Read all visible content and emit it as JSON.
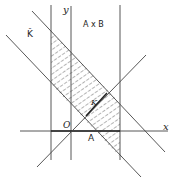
{
  "diagram": {
    "labels": {
      "y_axis": "y",
      "x_axis": "x",
      "origin": "O",
      "point_a": "A",
      "product": "A x B",
      "k_hat": "K̂",
      "k": "K"
    },
    "colors": {
      "line": "#333333",
      "hatch": "#444444",
      "background": "#ffffff"
    }
  }
}
